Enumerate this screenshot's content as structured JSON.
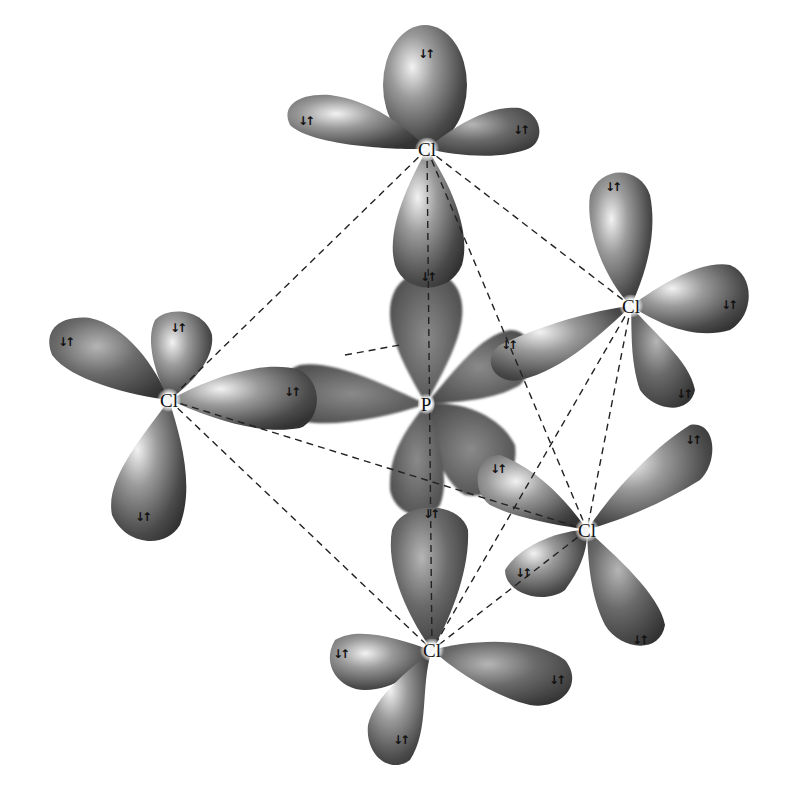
{
  "colors": {
    "lobe_light": "#e6e6e6",
    "lobe_mid": "#7a7a7a",
    "lobe_dark": "#3a3a3a",
    "p_lobe": "#5c5c5c",
    "dash": "#222222"
  },
  "spin_pair_symbol": "↓↑",
  "atoms": [
    {
      "id": "P",
      "label": "P",
      "x": 426,
      "y": 404
    },
    {
      "id": "Cl_top",
      "label": "Cl",
      "x": 427,
      "y": 149
    },
    {
      "id": "Cl_left",
      "label": "Cl",
      "x": 169,
      "y": 400
    },
    {
      "id": "Cl_right",
      "label": "Cl",
      "x": 631,
      "y": 306
    },
    {
      "id": "Cl_lower_right",
      "label": "Cl",
      "x": 587,
      "y": 530
    },
    {
      "id": "Cl_bottom",
      "label": "Cl",
      "x": 432,
      "y": 650
    }
  ],
  "bonds_dashed": [
    [
      427,
      149,
      169,
      400
    ],
    [
      427,
      149,
      631,
      306
    ],
    [
      427,
      149,
      587,
      530
    ],
    [
      169,
      400,
      432,
      650
    ],
    [
      169,
      400,
      587,
      530
    ],
    [
      631,
      306,
      587,
      530
    ],
    [
      631,
      306,
      432,
      650
    ],
    [
      587,
      530,
      432,
      650
    ],
    [
      427,
      149,
      432,
      650
    ],
    [
      345,
      355,
      400,
      345
    ]
  ],
  "spin_labels": [
    {
      "x": 425,
      "y": 54
    },
    {
      "x": 305,
      "y": 121
    },
    {
      "x": 520,
      "y": 130
    },
    {
      "x": 427,
      "y": 277
    },
    {
      "x": 65,
      "y": 342
    },
    {
      "x": 177,
      "y": 328
    },
    {
      "x": 291,
      "y": 392
    },
    {
      "x": 142,
      "y": 517
    },
    {
      "x": 612,
      "y": 187
    },
    {
      "x": 728,
      "y": 305
    },
    {
      "x": 508,
      "y": 345
    },
    {
      "x": 683,
      "y": 394
    },
    {
      "x": 497,
      "y": 469
    },
    {
      "x": 692,
      "y": 440
    },
    {
      "x": 522,
      "y": 573
    },
    {
      "x": 639,
      "y": 640
    },
    {
      "x": 430,
      "y": 514
    },
    {
      "x": 340,
      "y": 654
    },
    {
      "x": 556,
      "y": 680
    },
    {
      "x": 400,
      "y": 740
    }
  ]
}
